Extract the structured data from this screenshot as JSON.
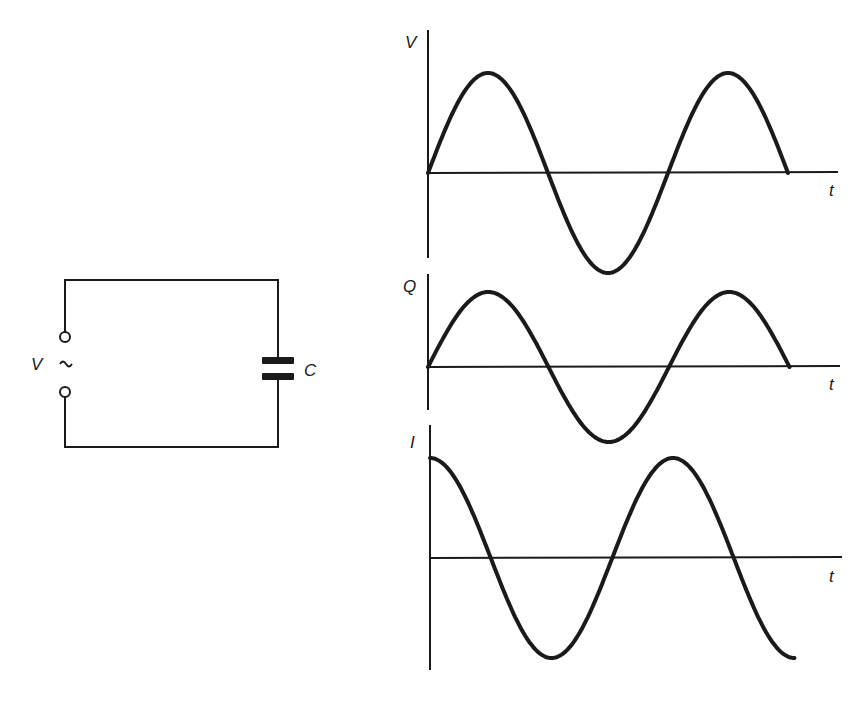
{
  "figure": {
    "colors": {
      "ink": "#1a1a1a",
      "background": "#ffffff"
    }
  },
  "circuit": {
    "source_label": "V",
    "source_symbol": "~",
    "capacitor_label": "C"
  },
  "graphs": [
    {
      "id": "voltage",
      "y_label": "V",
      "x_label": "t"
    },
    {
      "id": "charge",
      "y_label": "Q",
      "x_label": "t"
    },
    {
      "id": "current",
      "y_label": "I",
      "x_label": "t"
    }
  ],
  "chart_data": [
    {
      "type": "line",
      "title": "Voltage vs time",
      "ylabel": "V",
      "xlabel": "t",
      "function": "sine",
      "phase": "starts at zero, rising",
      "x_periods": [
        0,
        1.5
      ],
      "x": [
        0,
        0.25,
        0.5,
        0.75,
        1.0,
        1.25,
        1.5
      ],
      "values": [
        0,
        1,
        0,
        -1,
        0,
        1,
        0
      ],
      "grid": false
    },
    {
      "type": "line",
      "title": "Charge vs time",
      "ylabel": "Q",
      "xlabel": "t",
      "function": "sine (in phase with V)",
      "x": [
        0,
        0.25,
        0.5,
        0.75,
        1.0,
        1.25,
        1.5
      ],
      "values": [
        0,
        1,
        0,
        -1,
        0,
        1,
        0
      ],
      "grid": false
    },
    {
      "type": "line",
      "title": "Current vs time",
      "ylabel": "I",
      "xlabel": "t",
      "function": "cosine (leads V by 90 degrees)",
      "x": [
        0,
        0.25,
        0.5,
        0.75,
        1.0,
        1.25,
        1.5
      ],
      "values": [
        1,
        0,
        -1,
        0,
        1,
        0,
        -1
      ],
      "grid": false
    }
  ]
}
